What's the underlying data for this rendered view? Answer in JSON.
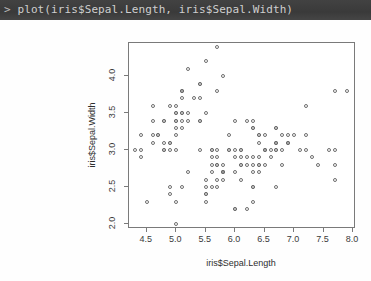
{
  "console": {
    "prompt": "> ",
    "command": "plot(iris$Sepal.Length, iris$Sepal.Width)",
    "bar_color": "#3d3d3d",
    "text_color": "#cfcfcf"
  },
  "chart_data": {
    "type": "scatter",
    "title": "",
    "xlabel": "iris$Sepal.Length",
    "ylabel": "iris$Sepal.Width",
    "xlim": [
      4.2,
      8.05
    ],
    "ylim": [
      1.93,
      4.45
    ],
    "xticks": [
      4.5,
      5.0,
      5.5,
      6.0,
      6.5,
      7.0,
      7.5,
      8.0
    ],
    "xticklabels": [
      "4.5",
      "5.0",
      "5.5",
      "6.0",
      "6.5",
      "7.0",
      "7.5",
      "8.0"
    ],
    "yticks": [
      2.0,
      2.5,
      3.0,
      3.5,
      4.0
    ],
    "yticklabels": [
      "2.0",
      "2.5",
      "3.0",
      "3.5",
      "4.0"
    ],
    "grid": false,
    "legend": false,
    "marker": "open-circle",
    "marker_color": "#6e6e6e",
    "series": [
      {
        "name": "iris",
        "x": [
          5.1,
          4.9,
          4.7,
          4.6,
          5.0,
          5.4,
          4.6,
          5.0,
          4.4,
          4.9,
          5.4,
          4.8,
          4.8,
          4.3,
          5.8,
          5.7,
          5.4,
          5.1,
          5.7,
          5.1,
          5.4,
          5.1,
          4.6,
          5.1,
          4.8,
          5.0,
          5.0,
          5.2,
          5.2,
          4.7,
          4.8,
          5.4,
          5.2,
          5.5,
          4.9,
          5.0,
          5.5,
          4.9,
          4.4,
          5.1,
          5.0,
          4.5,
          4.4,
          5.0,
          5.1,
          4.8,
          5.1,
          4.6,
          5.3,
          5.0,
          7.0,
          6.4,
          6.9,
          5.5,
          6.5,
          5.7,
          6.3,
          4.9,
          6.6,
          5.2,
          5.0,
          5.9,
          6.0,
          6.1,
          5.6,
          6.7,
          5.6,
          5.8,
          6.2,
          5.6,
          5.9,
          6.1,
          6.3,
          6.1,
          6.4,
          6.6,
          6.8,
          6.7,
          6.0,
          5.7,
          5.5,
          5.5,
          5.8,
          6.0,
          5.4,
          6.0,
          6.7,
          6.3,
          5.6,
          5.5,
          5.5,
          6.1,
          5.8,
          5.0,
          5.6,
          5.7,
          5.7,
          6.2,
          5.1,
          5.7,
          6.3,
          5.8,
          7.1,
          6.3,
          6.5,
          7.6,
          4.9,
          7.3,
          6.7,
          7.2,
          6.5,
          6.4,
          6.8,
          5.7,
          5.8,
          6.4,
          6.5,
          7.7,
          7.7,
          6.0,
          6.9,
          5.6,
          7.7,
          6.3,
          6.7,
          7.2,
          6.2,
          6.1,
          6.4,
          7.2,
          7.4,
          7.9,
          6.4,
          6.3,
          6.1,
          7.7,
          6.3,
          6.4,
          6.0,
          6.9,
          6.7,
          6.9,
          5.8,
          6.8,
          6.7,
          6.7,
          6.3,
          6.5,
          6.2,
          5.9
        ],
        "y": [
          3.5,
          3.0,
          3.2,
          3.1,
          3.6,
          3.9,
          3.4,
          3.4,
          2.9,
          3.1,
          3.7,
          3.4,
          3.0,
          3.0,
          4.0,
          4.4,
          3.9,
          3.5,
          3.8,
          3.8,
          3.4,
          3.7,
          3.6,
          3.3,
          3.4,
          3.0,
          3.4,
          3.5,
          3.4,
          3.2,
          3.1,
          3.4,
          4.1,
          4.2,
          3.1,
          3.2,
          3.5,
          3.6,
          3.0,
          3.4,
          3.5,
          2.3,
          3.2,
          3.5,
          3.8,
          3.0,
          3.8,
          3.2,
          3.7,
          3.3,
          3.2,
          3.2,
          3.1,
          2.3,
          2.8,
          2.8,
          3.3,
          2.4,
          2.9,
          2.7,
          2.0,
          3.0,
          2.2,
          2.9,
          2.9,
          3.1,
          3.0,
          2.7,
          2.2,
          2.5,
          3.2,
          2.8,
          2.5,
          2.8,
          2.9,
          3.0,
          2.8,
          3.0,
          2.9,
          2.6,
          2.4,
          2.4,
          2.7,
          2.7,
          3.0,
          3.4,
          3.1,
          2.3,
          3.0,
          2.5,
          2.6,
          3.0,
          2.6,
          2.3,
          2.7,
          3.0,
          2.9,
          2.9,
          2.5,
          2.8,
          3.3,
          2.7,
          3.0,
          2.9,
          3.0,
          3.0,
          2.5,
          2.9,
          2.5,
          3.6,
          3.2,
          2.7,
          3.0,
          2.5,
          2.8,
          3.2,
          3.0,
          3.8,
          2.6,
          2.2,
          3.2,
          2.8,
          2.8,
          2.7,
          3.3,
          3.2,
          2.8,
          3.0,
          2.8,
          3.0,
          2.8,
          3.8,
          2.8,
          2.8,
          2.6,
          3.0,
          3.4,
          3.1,
          3.0,
          3.1,
          3.1,
          3.1,
          2.7,
          3.2,
          3.3,
          3.0,
          2.5,
          3.0,
          3.4,
          3.0
        ]
      }
    ]
  }
}
